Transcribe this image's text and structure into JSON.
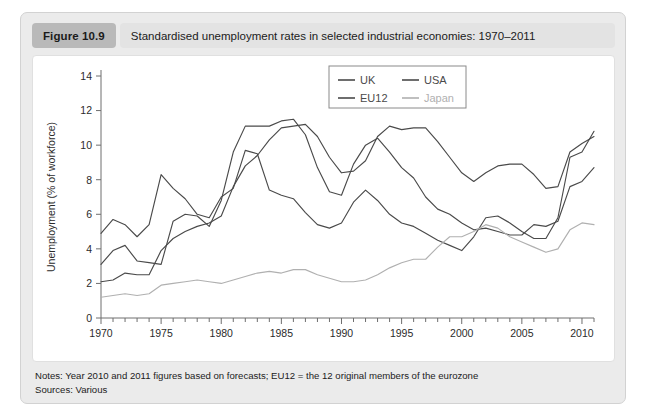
{
  "figure": {
    "badge": "Figure 10.9",
    "caption": "Standardised unemployment rates in selected industrial economies: 1970–2011"
  },
  "notes": {
    "line1": "Notes: Year 2010 and 2011 figures based on forecasts; EU12 = the 12 original members of the eurozone",
    "line2": "Sources: Various"
  },
  "colors": {
    "uk": "#4a4a4a",
    "usa": "#4a4a4a",
    "eu12": "#4a4a4a",
    "japan": "#b0b0b0",
    "axis": "#6e6e6e",
    "badge_bg": "#b9b9b9",
    "caption_bg": "#e3e3e3",
    "card_bg": "#ebebeb",
    "plot_bg": "#ffffff"
  },
  "chart_data": {
    "type": "line",
    "title": "Standardised unemployment rates in selected industrial economies: 1970–2011",
    "xlabel": "",
    "ylabel": "Unemployment (% of workforce)",
    "xlim": [
      1970,
      2011
    ],
    "ylim": [
      0,
      14
    ],
    "yticks": [
      0,
      2,
      4,
      6,
      8,
      10,
      12,
      14
    ],
    "xticks": [
      1970,
      1975,
      1980,
      1985,
      1990,
      1995,
      2000,
      2005,
      2010
    ],
    "x_minor_tick_step": 1,
    "grid": false,
    "legend_position": "top-center-right",
    "x": [
      1970,
      1971,
      1972,
      1973,
      1974,
      1975,
      1976,
      1977,
      1978,
      1979,
      1980,
      1981,
      1982,
      1983,
      1984,
      1985,
      1986,
      1987,
      1988,
      1989,
      1990,
      1991,
      1992,
      1993,
      1994,
      1995,
      1996,
      1997,
      1998,
      1999,
      2000,
      2001,
      2002,
      2003,
      2004,
      2005,
      2006,
      2007,
      2008,
      2009,
      2010,
      2011
    ],
    "series": [
      {
        "name": "UK",
        "color": "#4a4a4a",
        "values": [
          3.1,
          3.9,
          4.2,
          3.3,
          3.2,
          3.1,
          5.6,
          6.0,
          5.9,
          5.3,
          6.8,
          9.6,
          11.1,
          11.1,
          11.1,
          11.4,
          11.5,
          10.6,
          8.7,
          7.3,
          7.1,
          8.9,
          10.0,
          10.4,
          9.6,
          8.7,
          8.1,
          7.0,
          6.3,
          6.0,
          5.5,
          5.1,
          5.2,
          5.0,
          4.8,
          4.8,
          5.4,
          5.3,
          5.6,
          7.6,
          7.9,
          8.7
        ]
      },
      {
        "name": "USA",
        "color": "#4a4a4a",
        "values": [
          4.9,
          5.7,
          5.4,
          4.7,
          5.4,
          8.3,
          7.5,
          6.9,
          6.0,
          5.8,
          7.0,
          7.5,
          9.7,
          9.5,
          7.4,
          7.1,
          6.9,
          6.1,
          5.4,
          5.2,
          5.5,
          6.7,
          7.4,
          6.8,
          6.0,
          5.5,
          5.3,
          4.9,
          4.5,
          4.2,
          3.9,
          4.7,
          5.8,
          5.9,
          5.5,
          5.0,
          4.6,
          4.6,
          5.8,
          9.3,
          9.6,
          10.8
        ]
      },
      {
        "name": "EU12",
        "color": "#4a4a4a",
        "values": [
          2.1,
          2.2,
          2.6,
          2.5,
          2.5,
          3.9,
          4.6,
          5.0,
          5.3,
          5.5,
          5.9,
          7.6,
          8.8,
          9.4,
          10.3,
          11.0,
          11.1,
          11.2,
          10.5,
          9.3,
          8.4,
          8.5,
          9.1,
          10.5,
          11.1,
          10.9,
          11.0,
          11.0,
          10.2,
          9.3,
          8.4,
          7.9,
          8.4,
          8.8,
          8.9,
          8.9,
          8.3,
          7.5,
          7.6,
          9.6,
          10.1,
          10.5
        ]
      },
      {
        "name": "Japan",
        "color": "#b0b0b0",
        "values": [
          1.2,
          1.3,
          1.4,
          1.3,
          1.4,
          1.9,
          2.0,
          2.1,
          2.2,
          2.1,
          2.0,
          2.2,
          2.4,
          2.6,
          2.7,
          2.6,
          2.8,
          2.8,
          2.5,
          2.3,
          2.1,
          2.1,
          2.2,
          2.5,
          2.9,
          3.2,
          3.4,
          3.4,
          4.1,
          4.7,
          4.7,
          5.0,
          5.4,
          5.2,
          4.7,
          4.4,
          4.1,
          3.8,
          4.0,
          5.1,
          5.5,
          5.4
        ]
      }
    ],
    "legend": [
      {
        "label": "UK",
        "color": "#4a4a4a"
      },
      {
        "label": "USA",
        "color": "#4a4a4a"
      },
      {
        "label": "EU12",
        "color": "#4a4a4a"
      },
      {
        "label": "Japan",
        "color": "#b0b0b0"
      }
    ]
  }
}
